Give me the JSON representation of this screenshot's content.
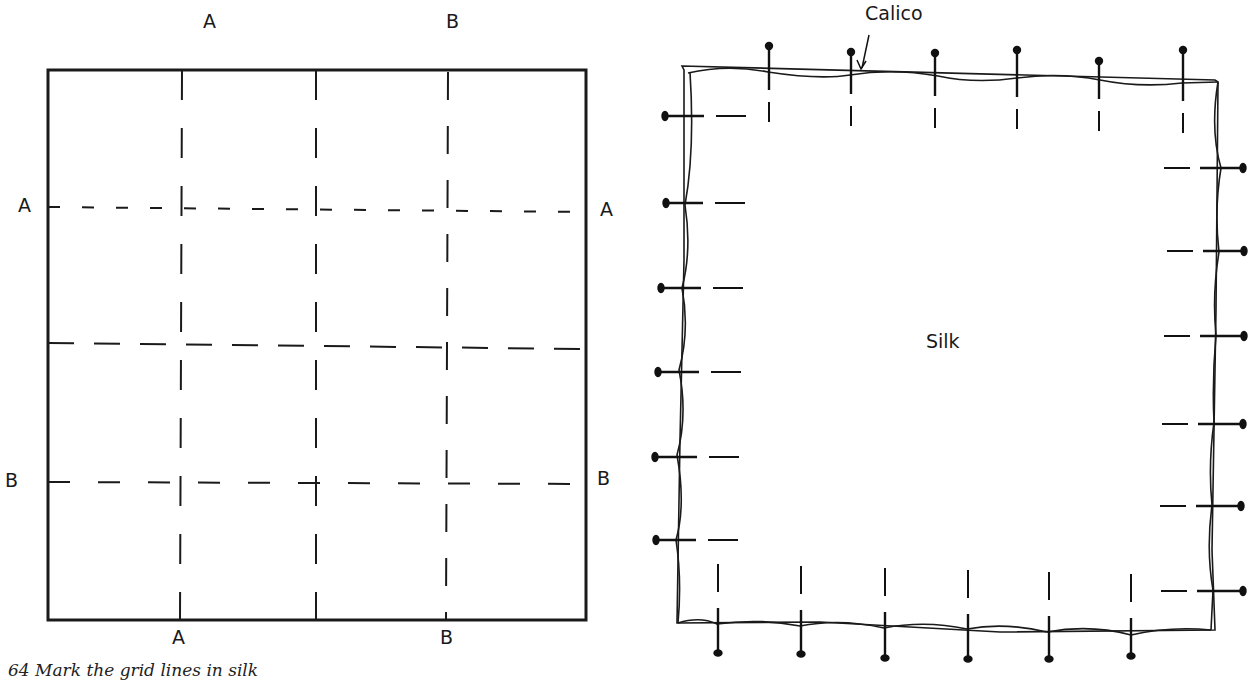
{
  "figure": {
    "caption": "64  Mark the grid lines in silk"
  },
  "left_diagram": {
    "name": "grid-marking-diagram",
    "top_labels": [
      "A",
      "B"
    ],
    "bottom_labels": [
      "A",
      "B"
    ],
    "left_labels": [
      "A",
      "B"
    ],
    "right_labels": [
      "A",
      "B"
    ]
  },
  "right_diagram": {
    "name": "silk-pinned-to-calico-diagram",
    "callout_label": "Calico",
    "center_label": "Silk",
    "pins": {
      "top": 6,
      "bottom": 6,
      "left": 6,
      "right": 6
    }
  }
}
